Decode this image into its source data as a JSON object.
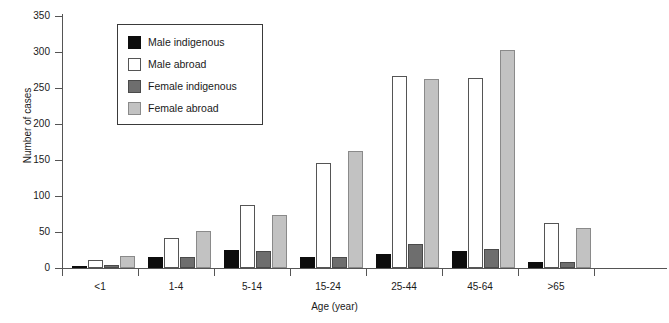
{
  "chart_data": {
    "type": "bar",
    "title": "",
    "xlabel": "Age (year)",
    "ylabel": "Number of cases",
    "ylim": [
      0,
      350
    ],
    "yticks": [
      0,
      50,
      100,
      150,
      200,
      250,
      300,
      350
    ],
    "grid": false,
    "legend_position": "upper-left-inside",
    "categories": [
      "<1",
      "1-4",
      "5-14",
      "15-24",
      "25-44",
      "45-64",
      ">65"
    ],
    "series": [
      {
        "name": "Male indigenous",
        "color": "#0d0d0d",
        "values": [
          3,
          15,
          25,
          15,
          20,
          24,
          9
        ]
      },
      {
        "name": "Male abroad",
        "color": "#ffffff",
        "values": [
          11,
          41,
          87,
          146,
          267,
          264,
          62
        ]
      },
      {
        "name": "Female indigenous",
        "color": "#6e6e6e",
        "values": [
          4,
          15,
          23,
          15,
          33,
          27,
          8
        ]
      },
      {
        "name": "Female abroad",
        "color": "#c2c2c2",
        "values": [
          17,
          52,
          73,
          163,
          263,
          303,
          56
        ]
      }
    ]
  },
  "legend": {
    "items": [
      {
        "label": "Male indigenous"
      },
      {
        "label": "Male abroad"
      },
      {
        "label": "Female indigenous"
      },
      {
        "label": "Female abroad"
      }
    ]
  },
  "axes": {
    "y_title": "Number of cases",
    "x_title": "Age (year)",
    "y_tick_labels": [
      "0",
      "50",
      "100",
      "150",
      "200",
      "250",
      "300",
      "350"
    ],
    "x_tick_labels": [
      "<1",
      "1-4",
      "5-14",
      "15-24",
      "25-44",
      "45-64",
      ">65"
    ]
  }
}
